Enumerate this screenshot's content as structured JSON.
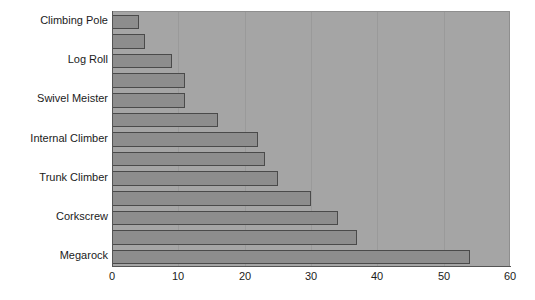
{
  "chart_data": {
    "type": "bar",
    "orientation": "horizontal",
    "title": "",
    "subtitle": "",
    "xlabel": "",
    "ylabel": "",
    "xlim": [
      0,
      60
    ],
    "ylim": null,
    "grid": true,
    "legend": null,
    "xticks": [
      "0",
      "10",
      "20",
      "30",
      "40",
      "50",
      "60"
    ],
    "xtick_values": [
      0,
      10,
      20,
      30,
      40,
      50,
      60
    ],
    "categories": [
      "Climbing Pole",
      "",
      "Log Roll",
      "",
      "Swivel Meister",
      "",
      "Internal Climber",
      "",
      "Trunk Climber",
      "",
      "Corkscrew",
      "",
      "Megarock"
    ],
    "values": [
      4,
      5,
      9,
      11,
      11,
      16,
      22,
      23,
      25,
      30,
      34,
      37,
      54
    ],
    "visible_category_labels": [
      "Climbing Pole",
      "Log Roll",
      "Swivel Meister",
      "Internal Climber",
      "Trunk Climber",
      "Corkscrew",
      "Megarock"
    ]
  },
  "style": {
    "plot_background": "#a5a5a5",
    "bar_fill": "#8d8d8d",
    "bar_stroke": "#4a4a4a",
    "gridline_color": "#9a9a9a",
    "axis_color": "#555555",
    "text_color": "#1b1b1b",
    "page_background": "#ffffff"
  }
}
